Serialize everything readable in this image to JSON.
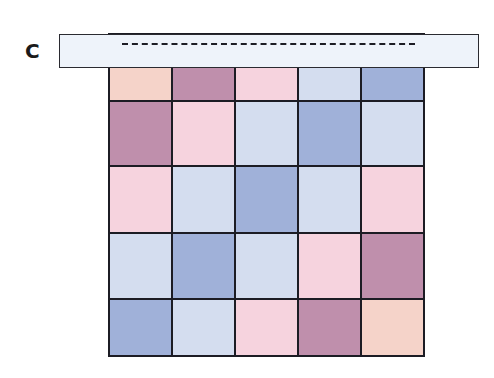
{
  "panel": {
    "label": "C"
  },
  "palette": {
    "peach": "#f5d3c9",
    "mauve": "#bf8fac",
    "lightpink": "#f6d3de",
    "lightblue": "#d4ddef",
    "medblue": "#a0b1d9"
  },
  "overlay_bar": {
    "fill": "#eef3fa",
    "line_style": "dashed"
  },
  "grid": {
    "rows": 5,
    "cols": 5,
    "cells": [
      [
        "peach",
        "mauve",
        "lightpink",
        "lightblue",
        "medblue"
      ],
      [
        "mauve",
        "lightpink",
        "lightblue",
        "medblue",
        "lightblue"
      ],
      [
        "lightpink",
        "lightblue",
        "medblue",
        "lightblue",
        "lightpink"
      ],
      [
        "lightblue",
        "medblue",
        "lightblue",
        "lightpink",
        "mauve"
      ],
      [
        "medblue",
        "lightblue",
        "lightpink",
        "mauve",
        "peach"
      ]
    ]
  }
}
